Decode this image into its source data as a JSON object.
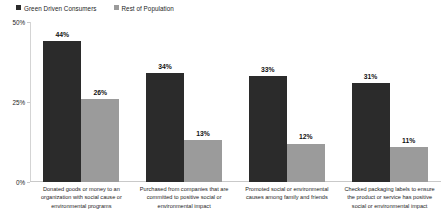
{
  "chart_data": {
    "type": "bar",
    "title": "",
    "xlabel": "",
    "ylabel": "",
    "ylim": [
      0,
      50
    ],
    "ytick_labels": [
      "0%",
      "25%",
      "50%"
    ],
    "ytick_values": [
      0,
      25,
      50
    ],
    "grid": false,
    "legend_position": "top-left",
    "value_suffix": "%",
    "categories": [
      "Donated goods or money to an organization with social cause or environmental programs",
      "Purchased from companies that are committed to positive social or environmental impact",
      "Promoted social or environmental causes among family and friends",
      "Checked packaging labels to ensure the product or service has positive social or environmental impact"
    ],
    "series": [
      {
        "name": "Green Driven Consumers",
        "color": "#2b2b2b",
        "values": [
          44,
          34,
          33,
          31
        ],
        "value_labels": [
          "44%",
          "34%",
          "33%",
          "31%"
        ]
      },
      {
        "name": "Rest of Population",
        "color": "#9b9b9b",
        "values": [
          26,
          13,
          12,
          11
        ],
        "value_labels": [
          "26%",
          "13%",
          "12%",
          "11%"
        ]
      }
    ]
  }
}
